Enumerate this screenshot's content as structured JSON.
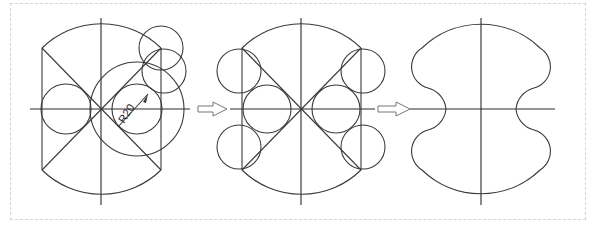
{
  "figure": {
    "steps": [
      {
        "id": "step-1",
        "description": "construction with auxiliary circles"
      },
      {
        "id": "step-2",
        "description": "tangent circles placed"
      },
      {
        "id": "step-3",
        "description": "final trimmed outline"
      }
    ],
    "dimension_label": "R20",
    "arrows": [
      "step-arrow-1",
      "step-arrow-2"
    ],
    "colors": {
      "line": "#3a3a3a",
      "border": "#d4d4d4",
      "arrow": "#777777"
    }
  }
}
